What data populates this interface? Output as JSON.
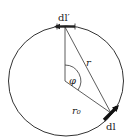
{
  "diagram": {
    "labels": {
      "dl_prime": "dl′",
      "dl": "dl",
      "r": "r",
      "phi": "φ",
      "r0": "r₀"
    },
    "colors": {
      "stroke": "#333333",
      "background": "#ffffff"
    }
  }
}
